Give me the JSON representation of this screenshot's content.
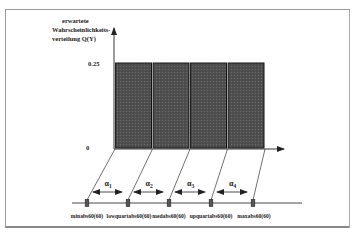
{
  "ylabel": [
    "erwartete",
    "Wahrscheinlichkeits-",
    "verteilung Q(Y)"
  ],
  "y_ticks": [
    {
      "label": "0.25",
      "value": 0.25
    },
    {
      "label": "0",
      "value": 0
    }
  ],
  "chart_data": {
    "type": "bar",
    "title": "",
    "ylabel": "erwartete Wahrscheinlichkeitsverteilung Q(Y)",
    "xlabel": "",
    "categories": [
      "α1",
      "α2",
      "α3",
      "α4"
    ],
    "values": [
      0.25,
      0.25,
      0.25,
      0.25
    ],
    "ylim": [
      0,
      0.25
    ],
    "grid": false
  },
  "intervals": [
    {
      "label": "α",
      "sub": "1"
    },
    {
      "label": "α",
      "sub": "2"
    },
    {
      "label": "α",
      "sub": "3"
    },
    {
      "label": "α",
      "sub": "4"
    }
  ],
  "markers": [
    "minabs60(60)",
    "lowquartabs60(60)",
    "medabs60(60)",
    "upquartabs60(60)",
    "maxabs60(60)"
  ],
  "colors": {
    "bar_fill": "#4a4a4a",
    "bar_stroke": "#111111",
    "line": "#333333",
    "frame": "#999999"
  }
}
